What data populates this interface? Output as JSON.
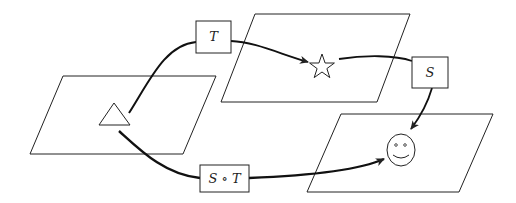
{
  "diagram": {
    "colors": {
      "stroke": "#222222",
      "background": "#ffffff"
    },
    "planes": [
      {
        "id": "plane-source",
        "points": "63,76 216,76 183,154 30,154",
        "shape": "triangle"
      },
      {
        "id": "plane-middle",
        "points": "255,14 410,14 377,102 221,102",
        "shape": "star"
      },
      {
        "id": "plane-target",
        "points": "341,114 493,114 459,192 307,192",
        "shape": "smiley"
      }
    ],
    "labels": {
      "T": "T",
      "S": "S",
      "SoT": "S ∘ T"
    },
    "shapes": {
      "triangle": "triangle-shape",
      "star": "star-shape",
      "smiley": "smiley-face"
    }
  }
}
